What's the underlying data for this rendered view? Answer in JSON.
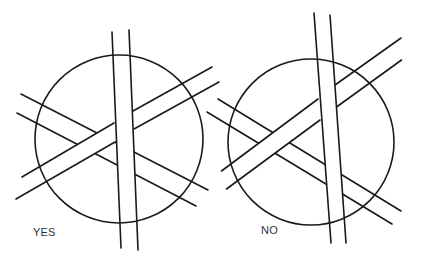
{
  "figure": {
    "type": "optical-illusion-diagram",
    "panels": [
      {
        "id": "left",
        "label": "YES"
      },
      {
        "id": "right",
        "label": "NO"
      }
    ],
    "line_color": "#1a1a1a",
    "background": "#ffffff"
  }
}
